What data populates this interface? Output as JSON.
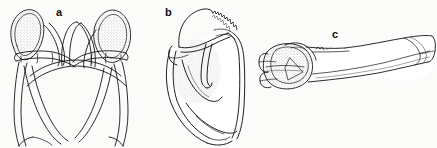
{
  "figure": {
    "kind": "anatomical-line-drawing-plate",
    "background_color": "#fbfbfa",
    "ink_color": "#111111",
    "stipple_color": "#6f6f6f",
    "width": 437,
    "height": 148,
    "panel_count": 3
  },
  "panels": [
    {
      "id": "a",
      "label": "a",
      "label_x": 56,
      "label_y": 7,
      "description": "Bilaterally symmetric paired girdle element, anterior view, with two stippled dorsal lobes and arching ventral rami",
      "shading": "stippled",
      "bbox": [
        4,
        6,
        146,
        146
      ]
    },
    {
      "id": "b",
      "label": "b",
      "label_x": 165,
      "label_y": 7,
      "description": "Broad blade-like element in lateral view with serrated dorsal margin, internal ridge and stippled fossa",
      "shading": "stippled",
      "bbox": [
        158,
        6,
        250,
        146
      ]
    },
    {
      "id": "c",
      "label": "c",
      "label_x": 332,
      "label_y": 29,
      "description": "Elongate long bone in dorsal view, proximal articular head at left with stippled facets, expanded distal end at right",
      "shading": "stippled",
      "bbox": [
        258,
        30,
        434,
        100
      ]
    }
  ]
}
